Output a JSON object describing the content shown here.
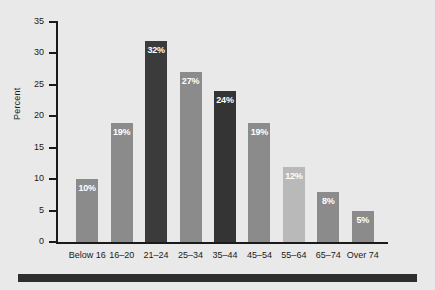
{
  "chart_data": {
    "type": "bar",
    "title": "",
    "subtitle": "",
    "xlabel": "",
    "ylabel": "Percent",
    "categories": [
      "Below 16",
      "16–20",
      "21–24",
      "25–34",
      "35–44",
      "45–54",
      "55–64",
      "65–74",
      "Over 74"
    ],
    "values": [
      10,
      19,
      32,
      27,
      24,
      19,
      12,
      8,
      5
    ],
    "data_labels": [
      "10%",
      "19%",
      "32%",
      "27%",
      "24%",
      "19%",
      "12%",
      "8%",
      "5%"
    ],
    "bar_colors": [
      "#8b8b8b",
      "#8b8b8b",
      "#3b3b3b",
      "#8b8b8b",
      "#343434",
      "#8b8b8b",
      "#b9b9b9",
      "#8b8b8b",
      "#8b8b8b"
    ],
    "ylim": [
      0,
      35
    ],
    "ytick_values": [
      0,
      5,
      10,
      15,
      20,
      25,
      30,
      35
    ],
    "ytick_labels": [
      "0",
      "5",
      "10",
      "15",
      "20",
      "25",
      "30",
      "35"
    ],
    "grid": false,
    "legend": null,
    "legend_position": "none",
    "annotations": []
  },
  "figure": {
    "background_color": "#e9e9e9",
    "axis_color": "#1a1a1a",
    "label_color": "#ffffff",
    "rule_color": "#2e2e2e"
  }
}
